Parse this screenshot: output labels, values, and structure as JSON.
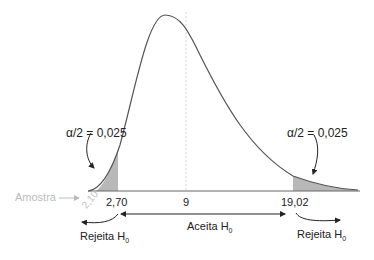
{
  "diagram": {
    "type": "chi-square distribution, two-tailed test",
    "left_tail": {
      "label": "α/2 = 0,025",
      "alpha": "α",
      "frac": "/2",
      "value": "= 0,025"
    },
    "right_tail": {
      "label": "α/2 = 0,025",
      "alpha": "α",
      "frac": "/2",
      "value": "= 0,025"
    },
    "sample_label": "Amostra",
    "sample_value": "2,10",
    "left_critical": "2,70",
    "center_value": "9",
    "right_critical": "19,02",
    "accept_label": "Aceita H",
    "reject_left_label": "Rejeita H",
    "reject_right_label": "Rejeita H",
    "subscript": "0",
    "colors": {
      "curve": "#555555",
      "shade": "#b8b8b8",
      "sample": "#c0c0c0",
      "dashed": "#d0d0d0"
    }
  }
}
